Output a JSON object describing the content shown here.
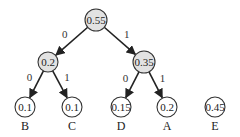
{
  "diagram": {
    "type": "huffman-tree",
    "colors": {
      "internal_fill": "#e2e2e2",
      "leaf_fill": "#ffffff",
      "stroke": "#333333"
    },
    "nodes": [
      {
        "id": "root",
        "value": "0.55",
        "x": 96,
        "y": 20,
        "r": 11,
        "internal": true
      },
      {
        "id": "n02",
        "value": "0.2",
        "x": 48,
        "y": 62,
        "r": 10,
        "internal": true
      },
      {
        "id": "n035",
        "value": "0.35",
        "x": 144,
        "y": 62,
        "r": 11,
        "internal": true
      },
      {
        "id": "B",
        "value": "0.1",
        "x": 25,
        "y": 107,
        "r": 10,
        "internal": false,
        "symbol": "B"
      },
      {
        "id": "C",
        "value": "0.1",
        "x": 72,
        "y": 107,
        "r": 10,
        "internal": false,
        "symbol": "C"
      },
      {
        "id": "D",
        "value": "0.15",
        "x": 121,
        "y": 107,
        "r": 10,
        "internal": false,
        "symbol": "D"
      },
      {
        "id": "A",
        "value": "0.2",
        "x": 167,
        "y": 107,
        "r": 10,
        "internal": false,
        "symbol": "A"
      },
      {
        "id": "E",
        "value": "0.45",
        "x": 215,
        "y": 107,
        "r": 10,
        "internal": false,
        "symbol": "E"
      }
    ],
    "edges": [
      {
        "from": "root",
        "to": "n02",
        "label": "0"
      },
      {
        "from": "root",
        "to": "n035",
        "label": "1"
      },
      {
        "from": "n02",
        "to": "B",
        "label": "0"
      },
      {
        "from": "n02",
        "to": "C",
        "label": "1"
      },
      {
        "from": "n035",
        "to": "D",
        "label": "0"
      },
      {
        "from": "n035",
        "to": "A",
        "label": "1"
      }
    ]
  }
}
